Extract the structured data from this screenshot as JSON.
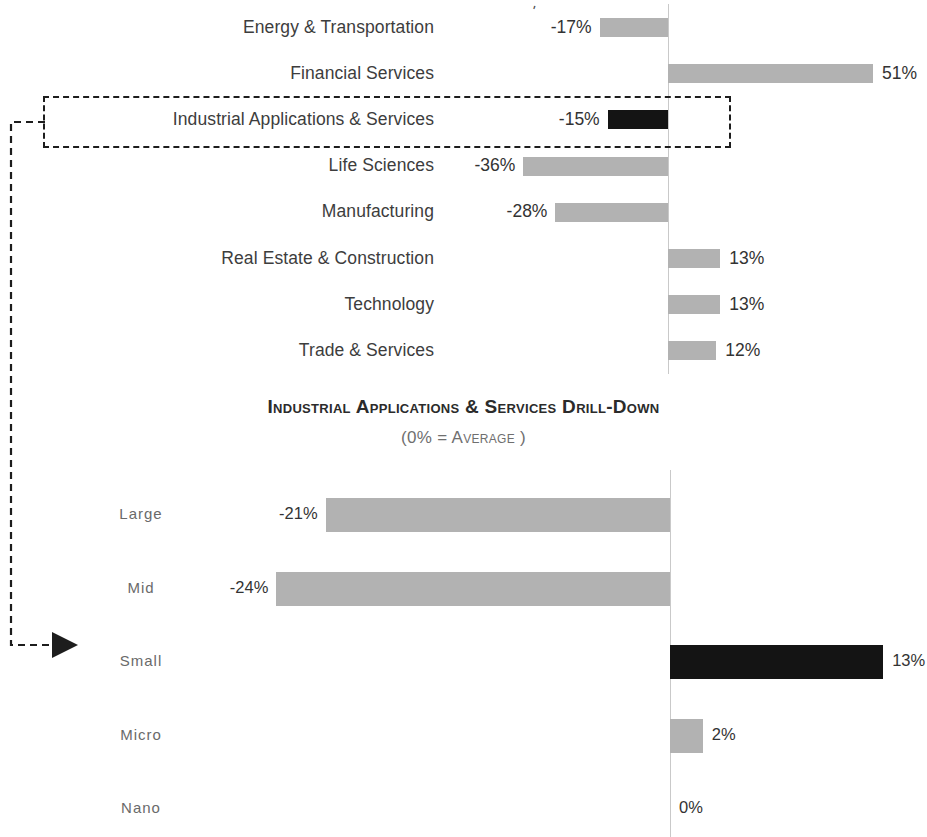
{
  "chart_data": [
    {
      "type": "bar",
      "orientation": "horizontal",
      "title": "",
      "subtitle": "",
      "xlabel": "",
      "ylabel": "",
      "unit": "%",
      "zero_reference": 0,
      "categories": [
        "Energy & Transportation",
        "Financial Services",
        "Industrial Applications & Services",
        "Life Sciences",
        "Manufacturing",
        "Real Estate & Construction",
        "Technology",
        "Trade & Services"
      ],
      "values": [
        -17,
        51,
        -15,
        -36,
        -28,
        13,
        13,
        12
      ],
      "value_labels": [
        "-17%",
        "51%",
        "-15%",
        "-36%",
        "-28%",
        "13%",
        "13%",
        "12%"
      ],
      "highlighted_category": "Industrial Applications & Services",
      "grid": false,
      "legend": "none",
      "xlim": [
        -40,
        55
      ]
    },
    {
      "type": "bar",
      "orientation": "horizontal",
      "title": "Industrial Applications & Services Drill-Down",
      "subtitle": "(0% = Average )",
      "xlabel": "",
      "ylabel": "",
      "unit": "%",
      "zero_reference": 0,
      "categories": [
        "Large",
        "Mid",
        "Small",
        "Micro",
        "Nano"
      ],
      "values": [
        -21,
        -24,
        13,
        2,
        0
      ],
      "value_labels": [
        "-21%",
        "-24%",
        "13%",
        "2%",
        "0%"
      ],
      "highlighted_category": "Small",
      "grid": false,
      "legend": "none",
      "xlim": [
        -25,
        14
      ]
    }
  ],
  "top_chart": {
    "bars": [
      {
        "label": "Energy & Transportation",
        "value_label": "-17%",
        "value": -17,
        "color": "#b2b2b2",
        "dark": false
      },
      {
        "label": "Financial Services",
        "value_label": "51%",
        "value": 51,
        "color": "#b2b2b2",
        "dark": false
      },
      {
        "label": "Industrial Applications & Services",
        "value_label": "-15%",
        "value": -15,
        "color": "#141414",
        "dark": true
      },
      {
        "label": "Life Sciences",
        "value_label": "-36%",
        "value": -36,
        "color": "#b2b2b2",
        "dark": false
      },
      {
        "label": "Manufacturing",
        "value_label": "-28%",
        "value": -28,
        "color": "#b2b2b2",
        "dark": false
      },
      {
        "label": "Real Estate & Construction",
        "value_label": "13%",
        "value": 13,
        "color": "#b2b2b2",
        "dark": false
      },
      {
        "label": "Technology",
        "value_label": "13%",
        "value": 13,
        "color": "#b2b2b2",
        "dark": false
      },
      {
        "label": "Trade & Services",
        "value_label": "12%",
        "value": 12,
        "color": "#b2b2b2",
        "dark": false
      }
    ],
    "stray_mark": "'"
  },
  "drilldown": {
    "title": "Industrial Applications & Services Drill-Down",
    "subtitle": "(0% = Average )",
    "bars": [
      {
        "label": "Large",
        "value_label": "-21%",
        "value": -21,
        "color": "#b2b2b2",
        "dark": false
      },
      {
        "label": "Mid",
        "value_label": "-24%",
        "value": -24,
        "color": "#b2b2b2",
        "dark": false
      },
      {
        "label": "Small",
        "value_label": "13%",
        "value": 13,
        "color": "#141414",
        "dark": true
      },
      {
        "label": "Micro",
        "value_label": "2%",
        "value": 2,
        "color": "#b2b2b2",
        "dark": false
      },
      {
        "label": "Nano",
        "value_label": "0%",
        "value": 0,
        "color": "#b2b2b2",
        "dark": false
      }
    ]
  },
  "colors": {
    "bar_default": "#b2b2b2",
    "bar_highlight": "#141414",
    "axis_line": "#c9c9c9",
    "highlight_outline": "#1d1d1d",
    "connector": "#1d1d1d",
    "label_top": "#3d3d3d",
    "label_bottom": "#6a6a6a",
    "value_text": "#333333",
    "title_text": "#2b2b2b",
    "subtitle_text": "#6f6f6f",
    "background": "#ffffff"
  }
}
